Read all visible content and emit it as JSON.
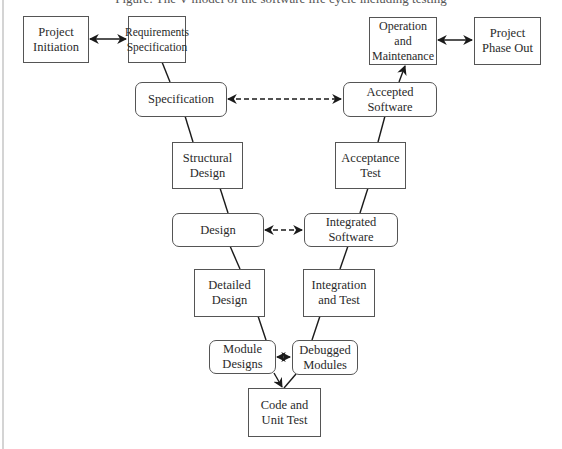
{
  "caption": "Figure: The V-model of the software life cycle including testing",
  "nodes": {
    "project_initiation": {
      "lines": [
        "Project",
        "Initiation"
      ],
      "shape": "rect"
    },
    "requirements_specification": {
      "lines": [
        "Requirements",
        "Specification"
      ],
      "shape": "rect"
    },
    "operation_maintenance": {
      "lines": [
        "Operation and",
        "Maintenance"
      ],
      "shape": "rect"
    },
    "project_phase_out": {
      "lines": [
        "Project",
        "Phase Out"
      ],
      "shape": "rect"
    },
    "specification": {
      "lines": [
        "Specification"
      ],
      "shape": "rounded"
    },
    "accepted_software": {
      "lines": [
        "Accepted",
        "Software"
      ],
      "shape": "rounded"
    },
    "structural_design": {
      "lines": [
        "Structural",
        "Design"
      ],
      "shape": "rect"
    },
    "acceptance_test": {
      "lines": [
        "Acceptance",
        "Test"
      ],
      "shape": "rect"
    },
    "design": {
      "lines": [
        "Design"
      ],
      "shape": "rounded"
    },
    "integrated_software": {
      "lines": [
        "Integrated",
        "Software"
      ],
      "shape": "rounded"
    },
    "detailed_design": {
      "lines": [
        "Detailed",
        "Design"
      ],
      "shape": "rect"
    },
    "integration_test": {
      "lines": [
        "Integration",
        "and Test"
      ],
      "shape": "rect"
    },
    "module_designs": {
      "lines": [
        "Module",
        "Designs"
      ],
      "shape": "rounded"
    },
    "debugged_modules": {
      "lines": [
        "Debugged",
        "Modules"
      ],
      "shape": "rounded"
    },
    "code_unit_test": {
      "lines": [
        "Code and",
        "Unit Test"
      ],
      "shape": "rect"
    }
  },
  "edges": [
    {
      "from": "project_initiation",
      "to": "requirements_specification",
      "style": "solid",
      "arrow": "both"
    },
    {
      "from": "operation_maintenance",
      "to": "project_phase_out",
      "style": "solid",
      "arrow": "both"
    },
    {
      "from": "requirements_specification",
      "to": "specification",
      "style": "solid",
      "arrow": "none"
    },
    {
      "from": "specification",
      "to": "structural_design",
      "style": "solid",
      "arrow": "none"
    },
    {
      "from": "structural_design",
      "to": "design",
      "style": "solid",
      "arrow": "none"
    },
    {
      "from": "design",
      "to": "detailed_design",
      "style": "solid",
      "arrow": "none"
    },
    {
      "from": "detailed_design",
      "to": "module_designs",
      "style": "solid",
      "arrow": "none"
    },
    {
      "from": "module_designs",
      "to": "code_unit_test",
      "style": "solid",
      "arrow": "end"
    },
    {
      "from": "code_unit_test",
      "to": "debugged_modules",
      "style": "solid",
      "arrow": "none"
    },
    {
      "from": "debugged_modules",
      "to": "integration_test",
      "style": "solid",
      "arrow": "none"
    },
    {
      "from": "integration_test",
      "to": "integrated_software",
      "style": "solid",
      "arrow": "none"
    },
    {
      "from": "integrated_software",
      "to": "acceptance_test",
      "style": "solid",
      "arrow": "none"
    },
    {
      "from": "acceptance_test",
      "to": "accepted_software",
      "style": "solid",
      "arrow": "none"
    },
    {
      "from": "accepted_software",
      "to": "operation_maintenance",
      "style": "solid",
      "arrow": "end"
    },
    {
      "from": "specification",
      "to": "accepted_software",
      "style": "dashed",
      "arrow": "both"
    },
    {
      "from": "design",
      "to": "integrated_software",
      "style": "dashed",
      "arrow": "both"
    },
    {
      "from": "module_designs",
      "to": "debugged_modules",
      "style": "solid",
      "arrow": "both"
    }
  ],
  "colors": {
    "line": "#1a1a1a",
    "border": "#555555",
    "background": "#ffffff",
    "left_rule": "#d4d4d4"
  }
}
